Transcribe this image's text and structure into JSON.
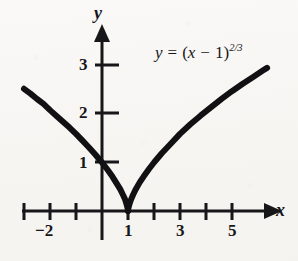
{
  "figure": {
    "background_color": "#f8f7f5",
    "ink_color": "#17171a",
    "width": 298,
    "height": 261
  },
  "axes": {
    "x_axis_name": "x",
    "y_axis_name": "y",
    "x_arrow": "arrow-right",
    "y_arrow": "arrow-up",
    "origin_px": {
      "x": 102,
      "y": 211
    },
    "unit_px": {
      "x": 26,
      "y": 48.5
    },
    "x_ticks": [
      {
        "value": -3,
        "label": ""
      },
      {
        "value": -2,
        "label": "−2"
      },
      {
        "value": -1,
        "label": ""
      },
      {
        "value": 1,
        "label": "1"
      },
      {
        "value": 2,
        "label": ""
      },
      {
        "value": 3,
        "label": "3"
      },
      {
        "value": 4,
        "label": ""
      },
      {
        "value": 5,
        "label": "5"
      }
    ],
    "y_ticks": [
      {
        "value": 1,
        "label": "1"
      },
      {
        "value": 2,
        "label": "2"
      },
      {
        "value": 3,
        "label": "3"
      }
    ]
  },
  "annotations": {
    "equation": {
      "lhs": "y",
      "equals": "=",
      "open_paren": "(",
      "base_var": "x",
      "minus": "−",
      "one": "1",
      "close_paren": ")",
      "exponent": "2/3",
      "plain_text": "y = (x − 1)^(2/3)"
    }
  },
  "chart_data": {
    "type": "line",
    "title": "",
    "xlabel": "x",
    "ylabel": "y",
    "xlim": [
      -3.6,
      6.8
    ],
    "ylim": [
      -0.5,
      3.5
    ],
    "grid": false,
    "legend": null,
    "function": "y = (x - 1)^(2/3)",
    "cusp_point": {
      "x": 1,
      "y": 0
    },
    "y_intercept": {
      "x": 0,
      "y": 1
    },
    "series": [
      {
        "name": "left-branch",
        "x": [
          -3.0,
          -2.75,
          -2.5,
          -2.25,
          -2.0,
          -1.75,
          -1.5,
          -1.25,
          -1.0,
          -0.75,
          -0.5,
          -0.25,
          0.0,
          0.2,
          0.4,
          0.55,
          0.7,
          0.8,
          0.88,
          0.94,
          0.98,
          1.0
        ],
        "y": [
          2.52,
          2.42,
          2.31,
          2.21,
          2.08,
          1.96,
          1.84,
          1.72,
          1.59,
          1.45,
          1.31,
          1.16,
          1.0,
          0.86,
          0.71,
          0.58,
          0.45,
          0.34,
          0.25,
          0.15,
          0.07,
          0.0
        ]
      },
      {
        "name": "right-branch",
        "x": [
          1.0,
          1.02,
          1.06,
          1.12,
          1.2,
          1.3,
          1.45,
          1.6,
          1.8,
          2.0,
          2.3,
          2.6,
          3.0,
          3.4,
          3.8,
          4.2,
          4.6,
          5.0,
          5.4,
          5.8,
          6.2,
          6.35
        ],
        "y": [
          0.0,
          0.07,
          0.15,
          0.24,
          0.34,
          0.45,
          0.59,
          0.71,
          0.86,
          1.0,
          1.19,
          1.36,
          1.59,
          1.79,
          1.97,
          2.14,
          2.31,
          2.47,
          2.62,
          2.76,
          2.9,
          2.95
        ]
      }
    ]
  }
}
